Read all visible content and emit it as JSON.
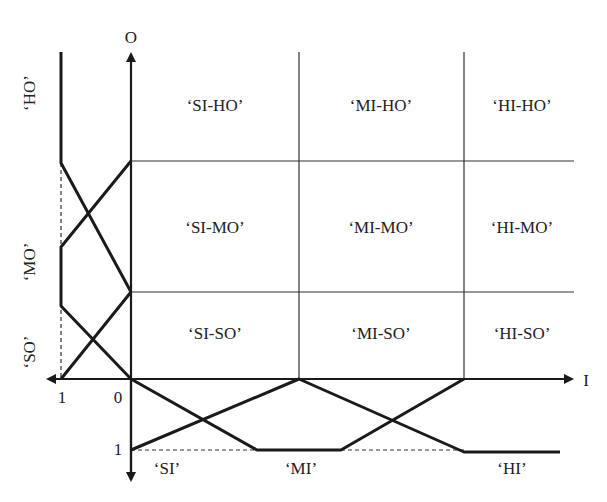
{
  "axes": {
    "output_axis_label": "O",
    "input_axis_label": "I",
    "output_membership_ticks": {
      "zero": "0",
      "one": "1"
    },
    "input_membership_ticks": {
      "zero": "0",
      "one": "1"
    }
  },
  "output_sets": {
    "high": "‘HO’",
    "medium": "‘MO’",
    "small": "‘SO’"
  },
  "input_sets": {
    "small": "‘SI’",
    "medium": "‘MI’",
    "high": "‘HI’"
  },
  "grid": {
    "rows": [
      {
        "cells": [
          "‘SI-HO’",
          "‘MI-HO’",
          "‘HI-HO’"
        ]
      },
      {
        "cells": [
          "‘SI-MO’",
          "‘MI-MO’",
          "‘HI-MO’"
        ]
      },
      {
        "cells": [
          "‘SI-SO’",
          "‘MI-SO’",
          "‘HI-SO’"
        ]
      }
    ]
  },
  "colors": {
    "line": "#1a1a1a",
    "grid": "#333333",
    "text": "#222222"
  }
}
